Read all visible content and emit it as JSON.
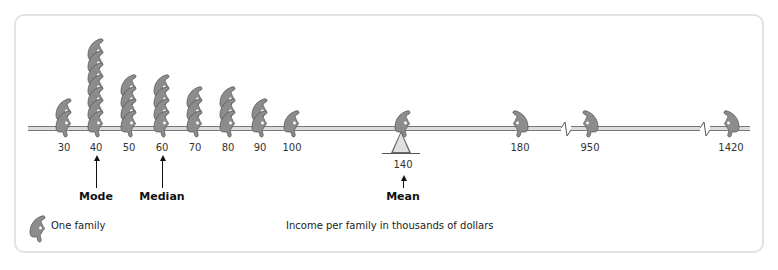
{
  "chart_data": {
    "type": "pictograph",
    "title": "",
    "xlabel": "Income per family in thousands of dollars",
    "ylabel": "",
    "unit_label": "One family",
    "categories": [
      "30",
      "40",
      "50",
      "60",
      "70",
      "80",
      "90",
      "100",
      "140",
      "180",
      "950",
      "1420"
    ],
    "values": [
      2,
      7,
      4,
      4,
      3,
      3,
      2,
      1,
      0,
      1,
      1,
      1
    ],
    "total_families": 30,
    "axis_breaks_between": [
      [
        "180",
        "950"
      ],
      [
        "950",
        "1420"
      ]
    ],
    "annotations": [
      {
        "label": "Mode",
        "at": "40"
      },
      {
        "label": "Median",
        "at": "60"
      },
      {
        "label": "Mean",
        "at": "140"
      }
    ],
    "fulcrum_at": "140",
    "colors": {
      "figure": "#8c8c8c",
      "figure_outline": "#5a5a5a",
      "beam": "#dcdcdc",
      "text": "#222222"
    }
  },
  "axis": {
    "ticks": [
      {
        "label": "30",
        "x": 64,
        "count": 2,
        "facing": "left"
      },
      {
        "label": "40",
        "x": 96,
        "count": 7,
        "facing": "left"
      },
      {
        "label": "50",
        "x": 129,
        "count": 4,
        "facing": "left"
      },
      {
        "label": "60",
        "x": 162,
        "count": 4,
        "facing": "left"
      },
      {
        "label": "70",
        "x": 195,
        "count": 3,
        "facing": "left"
      },
      {
        "label": "80",
        "x": 228,
        "count": 3,
        "facing": "left"
      },
      {
        "label": "90",
        "x": 260,
        "count": 2,
        "facing": "left"
      },
      {
        "label": "100",
        "x": 292,
        "count": 1,
        "facing": "left"
      },
      {
        "label": "140",
        "x": 403,
        "count": 1,
        "facing": "left"
      },
      {
        "label": "180",
        "x": 520,
        "count": 1,
        "facing": "right"
      },
      {
        "label": "950",
        "x": 590,
        "count": 1,
        "facing": "right"
      },
      {
        "label": "1420",
        "x": 731,
        "count": 1,
        "facing": "right"
      }
    ]
  },
  "stats": {
    "mode_label": "Mode",
    "median_label": "Median",
    "mean_label": "Mean",
    "mean_value": "140"
  },
  "legend": {
    "label": "One family",
    "icon": "seated-person-icon"
  },
  "axis_title": "Income per family in thousands of dollars"
}
